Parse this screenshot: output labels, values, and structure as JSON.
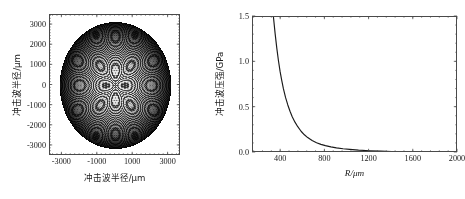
{
  "figure": {
    "background": "#ffffff",
    "line_color": "#1a1a1a",
    "axis_color": "#4a4a4a"
  },
  "panels": [
    {
      "id": "left",
      "name": "shockwave-radius-field-plot",
      "box": {
        "left": 49,
        "top": 14,
        "width": 131,
        "height": 141
      },
      "xlabel": "冲击波半径/μm",
      "ylabel": "冲击波半径/μm",
      "xticks": [
        "-3000",
        "-1000",
        "1000",
        "3000"
      ],
      "xtick_values": [
        -3000,
        -1000,
        1000,
        3000
      ],
      "yticks": [
        "3000",
        "2000",
        "1000",
        "0",
        "-1000",
        "-2000",
        "-3000"
      ],
      "ytick_values": [
        3000,
        2000,
        1000,
        0,
        -1000,
        -2000,
        -3000
      ],
      "xlim": [
        -3700,
        3700
      ],
      "ylim": [
        -3500,
        3500
      ],
      "xminor_count": 7,
      "yminor_count": 6
    },
    {
      "id": "right",
      "name": "shockwave-pressure-decay-plot",
      "box": {
        "left": 252,
        "top": 16,
        "width": 205,
        "height": 136
      },
      "xlabel": "R/μm",
      "ylabel": "冲击波压强/GPa",
      "xticks": [
        "400",
        "800",
        "1200",
        "1600",
        "2000"
      ],
      "xtick_values": [
        400,
        800,
        1200,
        1600,
        2000
      ],
      "yticks": [
        "0.0",
        "0.5",
        "1.0",
        "1.5"
      ],
      "ytick_values": [
        0.0,
        0.5,
        1.0,
        1.5
      ],
      "xlim": [
        145,
        2000
      ],
      "ylim": [
        0.0,
        1.5
      ],
      "xminor_count": 4,
      "yminor_count": 4
    }
  ],
  "chart_data": [
    {
      "type": "contour",
      "panel": "left",
      "title": "",
      "xlabel": "冲击波半径/μm",
      "ylabel": "冲击波半径/μm",
      "xlim": [
        -3700,
        3700
      ],
      "ylim": [
        -3500,
        3500
      ],
      "xticks": [
        -3000,
        -1000,
        1000,
        3000
      ],
      "yticks": [
        3000,
        2000,
        1000,
        0,
        -1000,
        -2000,
        -3000
      ],
      "grid": false,
      "legend": null,
      "description": "Dense concentric interference contour rings filling a disc of radius about 3150 um centred on the origin; ring spacing shrinks and the pattern darkens toward the circular boundary. Small secondary ring clusters (local extrema) appear near (0, +2200), (0, -2200), (-2200, 0) and (+2200, 0).",
      "disc_radius": 3150,
      "ring_count": 95,
      "secondary_clusters": [
        {
          "x": 0,
          "y": 2200
        },
        {
          "x": 0,
          "y": -2200
        },
        {
          "x": -2200,
          "y": 0
        },
        {
          "x": 2200,
          "y": 0
        }
      ]
    },
    {
      "type": "line",
      "panel": "right",
      "title": "",
      "xlabel": "R/μm",
      "ylabel": "冲击波压强/GPa",
      "xlim": [
        145,
        2000
      ],
      "ylim": [
        0.0,
        1.5
      ],
      "xticks": [
        400,
        800,
        1200,
        1600,
        2000
      ],
      "yticks": [
        0.0,
        0.5,
        1.0,
        1.5
      ],
      "grid": false,
      "legend": null,
      "series": [
        {
          "name": "冲击波压强",
          "x": [
            330,
            345,
            360,
            375,
            390,
            405,
            420,
            440,
            460,
            480,
            500,
            525,
            550,
            580,
            610,
            640,
            680,
            720,
            760,
            800,
            850,
            900,
            960,
            1020,
            1100,
            1200,
            1300,
            1400,
            1500,
            1600,
            1700,
            1800,
            1900,
            2000
          ],
          "y": [
            1.5,
            1.32,
            1.16,
            1.02,
            0.9,
            0.8,
            0.71,
            0.61,
            0.53,
            0.46,
            0.4,
            0.34,
            0.29,
            0.24,
            0.201,
            0.17,
            0.137,
            0.113,
            0.095,
            0.081,
            0.067,
            0.057,
            0.047,
            0.04,
            0.032,
            0.025,
            0.02,
            0.017,
            0.014,
            0.012,
            0.01,
            0.009,
            0.008,
            0.007
          ]
        }
      ]
    }
  ]
}
